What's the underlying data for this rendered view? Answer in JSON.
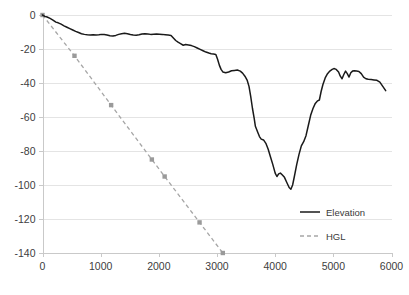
{
  "chart_data": {
    "type": "line",
    "title": "",
    "subtitle": "",
    "xlabel": "",
    "ylabel": "",
    "xlim": [
      0,
      6000
    ],
    "ylim": [
      -140,
      0
    ],
    "xticks": [
      0,
      1000,
      2000,
      3000,
      4000,
      5000,
      6000
    ],
    "yticks": [
      0,
      -20,
      -40,
      -60,
      -80,
      -100,
      -120,
      -140
    ],
    "xtick_labels": [
      "0",
      "1000",
      "2000",
      "3000",
      "4000",
      "5000",
      "6000"
    ],
    "ytick_labels": [
      "0",
      "-20",
      "-40",
      "-60",
      "-80",
      "-100",
      "-120",
      "-140"
    ],
    "grid": "horizontal",
    "legend_position": "inside-right-lower",
    "series": [
      {
        "name": "Elevation",
        "style": "solid",
        "color": "#1a1a1a",
        "marker": "none",
        "points": [
          [
            0,
            0
          ],
          [
            40,
            -0.8
          ],
          [
            80,
            -1.2
          ],
          [
            130,
            -2.0
          ],
          [
            180,
            -3.0
          ],
          [
            230,
            -4.2
          ],
          [
            270,
            -4.6
          ],
          [
            320,
            -5.4
          ],
          [
            370,
            -6.4
          ],
          [
            420,
            -7.2
          ],
          [
            470,
            -8.0
          ],
          [
            520,
            -8.8
          ],
          [
            570,
            -9.6
          ],
          [
            620,
            -10.3
          ],
          [
            670,
            -11.0
          ],
          [
            720,
            -11.4
          ],
          [
            770,
            -11.6
          ],
          [
            820,
            -11.7
          ],
          [
            870,
            -11.6
          ],
          [
            920,
            -11.8
          ],
          [
            970,
            -11.6
          ],
          [
            1010,
            -11.4
          ],
          [
            1060,
            -11.5
          ],
          [
            1110,
            -11.8
          ],
          [
            1160,
            -12.2
          ],
          [
            1210,
            -12.4
          ],
          [
            1260,
            -12.0
          ],
          [
            1310,
            -11.4
          ],
          [
            1360,
            -11.0
          ],
          [
            1410,
            -10.8
          ],
          [
            1460,
            -11.0
          ],
          [
            1510,
            -11.5
          ],
          [
            1560,
            -11.8
          ],
          [
            1610,
            -11.9
          ],
          [
            1660,
            -11.6
          ],
          [
            1710,
            -11.2
          ],
          [
            1760,
            -11.0
          ],
          [
            1810,
            -11.2
          ],
          [
            1860,
            -11.4
          ],
          [
            1910,
            -11.3
          ],
          [
            1960,
            -11.2
          ],
          [
            2010,
            -11.3
          ],
          [
            2060,
            -11.4
          ],
          [
            2110,
            -11.6
          ],
          [
            2160,
            -11.8
          ],
          [
            2210,
            -12.0
          ],
          [
            2250,
            -13.5
          ],
          [
            2290,
            -15.0
          ],
          [
            2330,
            -16.0
          ],
          [
            2380,
            -17.0
          ],
          [
            2420,
            -17.8
          ],
          [
            2460,
            -17.4
          ],
          [
            2510,
            -17.6
          ],
          [
            2560,
            -18.0
          ],
          [
            2610,
            -18.6
          ],
          [
            2660,
            -19.4
          ],
          [
            2710,
            -20.2
          ],
          [
            2760,
            -21.0
          ],
          [
            2810,
            -21.8
          ],
          [
            2860,
            -22.4
          ],
          [
            2900,
            -22.8
          ],
          [
            2940,
            -23.0
          ],
          [
            2980,
            -23.2
          ],
          [
            3010,
            -26.0
          ],
          [
            3040,
            -29.5
          ],
          [
            3070,
            -32.0
          ],
          [
            3100,
            -33.5
          ],
          [
            3150,
            -34.0
          ],
          [
            3200,
            -33.5
          ],
          [
            3250,
            -32.8
          ],
          [
            3300,
            -32.6
          ],
          [
            3350,
            -32.4
          ],
          [
            3400,
            -33.0
          ],
          [
            3440,
            -34.2
          ],
          [
            3480,
            -36.0
          ],
          [
            3520,
            -38.5
          ],
          [
            3550,
            -42.0
          ],
          [
            3580,
            -48.0
          ],
          [
            3610,
            -55.0
          ],
          [
            3640,
            -61.0
          ],
          [
            3660,
            -65.5
          ],
          [
            3700,
            -69.0
          ],
          [
            3730,
            -71.5
          ],
          [
            3760,
            -73.0
          ],
          [
            3800,
            -73.5
          ],
          [
            3840,
            -75.5
          ],
          [
            3880,
            -79.0
          ],
          [
            3920,
            -83.5
          ],
          [
            3960,
            -88.0
          ],
          [
            4000,
            -93.0
          ],
          [
            4030,
            -95.0
          ],
          [
            4060,
            -93.5
          ],
          [
            4090,
            -93.0
          ],
          [
            4120,
            -94.0
          ],
          [
            4160,
            -95.5
          ],
          [
            4200,
            -98.5
          ],
          [
            4240,
            -101.5
          ],
          [
            4270,
            -102.5
          ],
          [
            4300,
            -100.0
          ],
          [
            4330,
            -95.0
          ],
          [
            4370,
            -88.0
          ],
          [
            4410,
            -82.0
          ],
          [
            4450,
            -77.0
          ],
          [
            4490,
            -74.5
          ],
          [
            4530,
            -71.0
          ],
          [
            4570,
            -65.0
          ],
          [
            4610,
            -59.0
          ],
          [
            4650,
            -55.0
          ],
          [
            4690,
            -52.0
          ],
          [
            4730,
            -50.5
          ],
          [
            4760,
            -50.0
          ],
          [
            4790,
            -45.0
          ],
          [
            4820,
            -41.0
          ],
          [
            4860,
            -37.0
          ],
          [
            4900,
            -34.5
          ],
          [
            4940,
            -33.0
          ],
          [
            4980,
            -32.0
          ],
          [
            5010,
            -31.5
          ],
          [
            5050,
            -32.0
          ],
          [
            5090,
            -33.5
          ],
          [
            5120,
            -36.0
          ],
          [
            5150,
            -37.5
          ],
          [
            5180,
            -35.0
          ],
          [
            5210,
            -33.0
          ],
          [
            5240,
            -34.5
          ],
          [
            5270,
            -36.5
          ],
          [
            5300,
            -34.0
          ],
          [
            5330,
            -33.0
          ],
          [
            5360,
            -32.8
          ],
          [
            5400,
            -33.0
          ],
          [
            5440,
            -33.2
          ],
          [
            5480,
            -34.5
          ],
          [
            5520,
            -36.5
          ],
          [
            5560,
            -37.5
          ],
          [
            5600,
            -37.8
          ],
          [
            5650,
            -38.0
          ],
          [
            5700,
            -38.2
          ],
          [
            5750,
            -38.4
          ],
          [
            5800,
            -39.5
          ],
          [
            5850,
            -42.0
          ],
          [
            5900,
            -44.5
          ]
        ]
      },
      {
        "name": "HGL",
        "style": "dashed",
        "color": "#a6a6a6",
        "marker": "square",
        "points": [
          [
            0,
            0
          ],
          [
            550,
            -24
          ],
          [
            1180,
            -53
          ],
          [
            1880,
            -85
          ],
          [
            2100,
            -95
          ],
          [
            2700,
            -122
          ],
          [
            3100,
            -140
          ]
        ]
      }
    ]
  },
  "legend": {
    "items": [
      {
        "label": "Elevation",
        "style": "solid"
      },
      {
        "label": "HGL",
        "style": "dashed"
      }
    ]
  }
}
